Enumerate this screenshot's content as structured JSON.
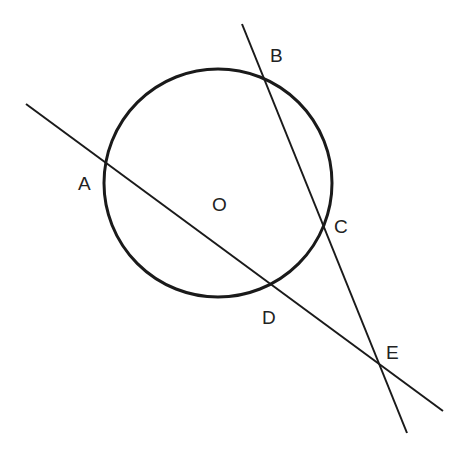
{
  "diagram": {
    "stroke_color": "#1a1a1a",
    "background": "#ffffff",
    "circle": {
      "center_label": "O",
      "cx": 218,
      "cy": 183,
      "r": 114
    },
    "lines": [
      {
        "name": "line-ADE",
        "x1": 26,
        "y1": 104,
        "x2": 443,
        "y2": 411
      },
      {
        "name": "line-BCE",
        "x1": 242,
        "y1": 24,
        "x2": 407,
        "y2": 433
      }
    ],
    "points": [
      {
        "label": "A",
        "x": 108,
        "y": 166,
        "label_x": 78,
        "label_y": 190
      },
      {
        "label": "B",
        "x": 263,
        "y": 77,
        "label_x": 270,
        "label_y": 62
      },
      {
        "label": "C",
        "x": 324,
        "y": 222,
        "label_x": 334,
        "label_y": 233
      },
      {
        "label": "D",
        "x": 272,
        "y": 285,
        "label_x": 262,
        "label_y": 324
      },
      {
        "label": "E",
        "x": 381,
        "y": 367,
        "label_x": 386,
        "label_y": 359
      },
      {
        "label": "O",
        "x": 218,
        "y": 183,
        "label_x": 212,
        "label_y": 211
      }
    ]
  }
}
